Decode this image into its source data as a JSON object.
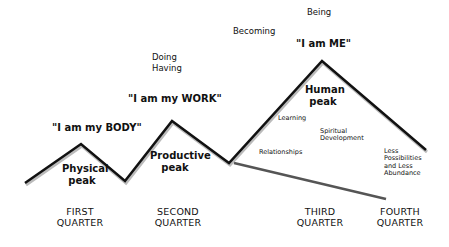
{
  "top_labels": {
    "being": "Being",
    "becoming": "Becoming",
    "doing": "Doing",
    "having": "Having"
  },
  "quotes": {
    "body": "\"I am my BODY\"",
    "work": "\"I am my WORK\"",
    "me": "\"I am ME\""
  },
  "peaks": {
    "physical": [
      "Physical",
      "peak"
    ],
    "productive": [
      "Productive",
      "peak"
    ],
    "human": [
      "Human",
      "peak"
    ]
  },
  "annotations": {
    "learning": "Learning",
    "relationships": "Relationships",
    "spiritual": [
      "Spiritual",
      "Development"
    ],
    "less": [
      "Less",
      "Possibilities",
      "and Less",
      "Abundance"
    ]
  },
  "quarters": [
    [
      "FIRST",
      "QUARTER"
    ],
    [
      "SECOND",
      "QUARTER"
    ],
    [
      "THIRD",
      "QUARTER"
    ],
    [
      "FOURTH",
      "QUARTER"
    ]
  ],
  "lines": {
    "main_color": "#111111",
    "decline_color": "#555555",
    "main_points": "25,183 81,144 125,181 172,121 229,163 322,61 426,150",
    "decline_points": "234,163 386,199"
  }
}
